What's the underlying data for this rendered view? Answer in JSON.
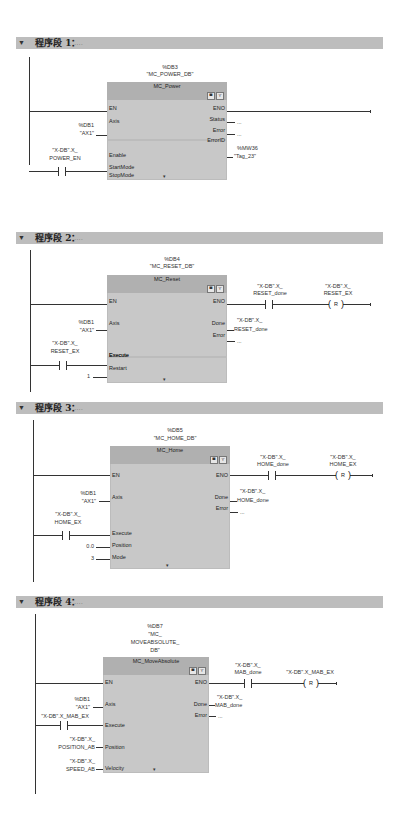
{
  "networks": [
    {
      "title": "程序段 1：",
      "comment": "....",
      "instance_db": "%DB3",
      "instance_name": "\"MC_POWER_DB\"",
      "block_name": "MC_Power",
      "inputs": [
        {
          "pin": "EN",
          "value": ""
        },
        {
          "pin": "Axis",
          "value_addr": "%DB1",
          "value": "\"AX1\""
        },
        {
          "pin": "Enable",
          "contact_tag_1": "\"X-DB\".X_",
          "contact_tag_2": "POWER_EN"
        },
        {
          "pin": "StartMode",
          "value": "1"
        },
        {
          "pin": "StopMode",
          "value": "0"
        }
      ],
      "outputs": [
        {
          "pin": "ENO"
        },
        {
          "pin": "Status",
          "value": "..."
        },
        {
          "pin": "Error",
          "value": "..."
        },
        {
          "pin": "ErrorID",
          "value_addr": "%MW36",
          "value": "\"Tag_23\""
        }
      ]
    },
    {
      "title": "程序段 2：",
      "comment": "....",
      "instance_db": "%DB4",
      "instance_name": "\"MC_RESET_DB\"",
      "block_name": "MC_Reset",
      "inputs": [
        {
          "pin": "EN"
        },
        {
          "pin": "Axis",
          "value_addr": "%DB1",
          "value": "\"AX1\""
        },
        {
          "pin": "Execute",
          "contact_tag_1": "\"X-DB\".X_",
          "contact_tag_2": "RESET_EX"
        },
        {
          "pin": "Restart",
          "value": "1"
        }
      ],
      "outputs": [
        {
          "pin": "ENO",
          "contact_tag_1": "\"X-DB\".X_",
          "contact_tag_2": "RESET_done",
          "coil_tag_1": "\"X-DB\".X_",
          "coil_tag_2": "RESET_EX",
          "coil_type": "R"
        },
        {
          "pin": "Done",
          "value_1": "\"X-DB\".X_",
          "value_2": "RESET_done"
        },
        {
          "pin": "Error",
          "value": "..."
        }
      ]
    },
    {
      "title": "程序段 3：",
      "comment": "....",
      "instance_db": "%DB5",
      "instance_name": "\"MC_HOME_DB\"",
      "block_name": "MC_Home",
      "inputs": [
        {
          "pin": "EN"
        },
        {
          "pin": "Axis",
          "value_addr": "%DB1",
          "value": "\"AX1\""
        },
        {
          "pin": "Execute",
          "contact_tag_1": "\"X-DB\".X_",
          "contact_tag_2": "HOME_EX"
        },
        {
          "pin": "Position",
          "value": "0.0"
        },
        {
          "pin": "Mode",
          "value": "3"
        }
      ],
      "outputs": [
        {
          "pin": "ENO",
          "contact_tag_1": "\"X-DB\".X_",
          "contact_tag_2": "HOME_done",
          "coil_tag_1": "\"X-DB\".X_",
          "coil_tag_2": "HOME_EX",
          "coil_type": "R"
        },
        {
          "pin": "Done",
          "value_1": "\"X-DB\".X_",
          "value_2": "HOME_done"
        },
        {
          "pin": "Error",
          "value": "..."
        }
      ]
    },
    {
      "title": "程序段 4：",
      "comment": "....",
      "instance_db": "%DB7",
      "instance_name_1": "\"MC_",
      "instance_name_2": "MOVEABSOLUTE_",
      "instance_name_3": "DB\"",
      "block_name": "MC_MoveAbsolute",
      "inputs": [
        {
          "pin": "EN"
        },
        {
          "pin": "Axis",
          "value_addr": "%DB1",
          "value": "\"AX1\""
        },
        {
          "pin": "Execute",
          "contact_tag": "\"X-DB\".X_MAB_EX"
        },
        {
          "pin": "Position",
          "value_1": "\"X-DB\".X_",
          "value_2": "POSITION_AB"
        },
        {
          "pin": "Velocity",
          "value_1": "\"X-DB\".X_",
          "value_2": "SPEED_AB"
        }
      ],
      "outputs": [
        {
          "pin": "ENO",
          "contact_tag_1": "\"X-DB\".X_",
          "contact_tag_2": "MAB_done",
          "coil_tag": "\"X-DB\".X_MAB_EX",
          "coil_type": "R"
        },
        {
          "pin": "Done",
          "value_1": "\"X-DB\".X_",
          "value_2": "MAB_done"
        },
        {
          "pin": "Error",
          "value": "..."
        }
      ]
    }
  ],
  "icons": {
    "collapse": "▼",
    "expand_block": "▾"
  }
}
